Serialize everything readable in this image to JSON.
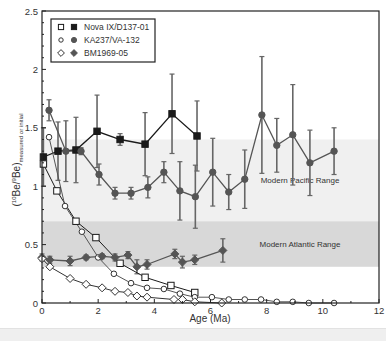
{
  "chart_data": {
    "type": "line",
    "title": "",
    "xlabel": "Age (Ma)",
    "ylabel_main": "(10Be/9Be)",
    "ylabel_sup_10": "10",
    "ylabel_sup_9": "9",
    "ylabel_sub": "measured or initial",
    "xlim": [
      0,
      12
    ],
    "ylim": [
      0,
      2.5
    ],
    "xticks": [
      0,
      2,
      4,
      6,
      8,
      10,
      12
    ],
    "yticks": [
      0,
      0.5,
      1,
      1.5,
      2,
      2.5
    ],
    "ytick_labels": [
      "0",
      "0.5",
      "1",
      "1.5",
      "2",
      "2.5"
    ],
    "grid": false,
    "legend_position": "upper left",
    "bands": [
      {
        "label": "Modern Pacific Range",
        "y0": 0.7,
        "y1": 1.4,
        "color": "#f0f0f0"
      },
      {
        "label": "Modern Atlantic Range",
        "y0": 0.31,
        "y1": 0.7,
        "color": "#d8d8d8"
      }
    ],
    "series": [
      {
        "name": "Nova IX/D137-01 (measured)",
        "legend": "Nova IX/D137-01",
        "marker": "square",
        "filled": true,
        "color": "#1a1a1a",
        "x": [
          0.05,
          0.57,
          1.21,
          1.96,
          2.78,
          3.67,
          4.63,
          5.52
        ],
        "y": [
          1.25,
          1.3,
          1.31,
          1.47,
          1.4,
          1.36,
          1.62,
          1.43
        ],
        "err": [
          0.25,
          0.25,
          0.28,
          0.31,
          0.05,
          0.27,
          0.34,
          0.3
        ]
      },
      {
        "name": "Nova IX/D137-01 (initial)",
        "marker": "square",
        "filled": false,
        "color": "#1a1a1a",
        "x": [
          0.05,
          0.53,
          1.21,
          1.92,
          2.78,
          3.67,
          4.59,
          5.44
        ],
        "y": [
          1.19,
          0.96,
          0.7,
          0.56,
          0.34,
          0.22,
          0.15,
          0.09
        ]
      },
      {
        "name": "KA237/VA-132 (measured)",
        "legend": "KA237/VA-132",
        "marker": "circle",
        "filled": true,
        "color": "#555555",
        "x": [
          0.25,
          0.85,
          1.39,
          2.03,
          2.6,
          3.17,
          3.77,
          4.34,
          4.91,
          5.46,
          6.08,
          6.65,
          7.22,
          7.83,
          8.36,
          8.93,
          9.54,
          10.4
        ],
        "y": [
          1.65,
          1.3,
          1.3,
          1.1,
          0.94,
          0.94,
          0.99,
          1.12,
          0.96,
          0.91,
          1.12,
          0.95,
          1.06,
          1.61,
          1.35,
          1.44,
          1.2,
          1.3
        ],
        "err": [
          0.09,
          0.26,
          0.03,
          0.09,
          0.05,
          0.05,
          0.09,
          0.09,
          0.25,
          0.27,
          0.29,
          0.15,
          0.25,
          0.5,
          0.23,
          0.43,
          0.28,
          0.2
        ]
      },
      {
        "name": "KA237/VA-132 (initial)",
        "marker": "circle",
        "filled": false,
        "color": "#555555",
        "x": [
          0.25,
          0.82,
          1.42,
          2.0,
          2.56,
          3.17,
          3.74,
          4.34,
          4.91,
          5.44,
          6.05,
          6.65,
          7.22,
          7.8,
          8.36,
          8.93,
          9.5,
          10.4
        ],
        "y": [
          1.42,
          0.83,
          0.61,
          0.39,
          0.25,
          0.17,
          0.13,
          0.12,
          0.08,
          0.05,
          0.05,
          0.03,
          0.03,
          0.03,
          0.01,
          0.01,
          0.0,
          0.0
        ]
      },
      {
        "name": "BM1969-05 (measured)",
        "legend": "BM1969-05",
        "marker": "diamond",
        "filled": true,
        "color": "#555555",
        "x": [
          0.0,
          0.28,
          1.0,
          1.57,
          2.14,
          2.6,
          3.06,
          3.38,
          3.74,
          4.73,
          5.0,
          5.44,
          6.44
        ],
        "y": [
          0.39,
          0.37,
          0.36,
          0.39,
          0.4,
          0.39,
          0.41,
          0.31,
          0.33,
          0.42,
          0.35,
          0.37,
          0.45
        ],
        "err": [
          0.03,
          0.03,
          0.04,
          0.02,
          0.02,
          0.03,
          0.03,
          0.06,
          0.04,
          0.04,
          0.05,
          0.04,
          0.1
        ]
      },
      {
        "name": "BM1969-05 (initial)",
        "marker": "diamond",
        "filled": false,
        "color": "#333333",
        "x": [
          0.0,
          0.28,
          1.0,
          1.57,
          2.14,
          2.6,
          3.06,
          3.38,
          3.74,
          4.7,
          5.0,
          5.44,
          6.4
        ],
        "y": [
          0.38,
          0.31,
          0.21,
          0.16,
          0.13,
          0.1,
          0.09,
          0.06,
          0.05,
          0.03,
          0.03,
          0.01,
          0.0
        ]
      }
    ]
  }
}
